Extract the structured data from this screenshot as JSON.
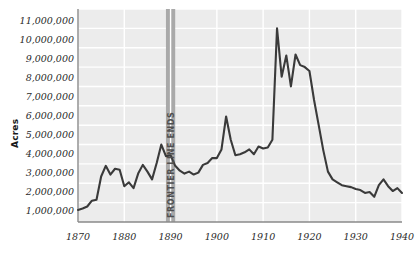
{
  "chart_data": {
    "type": "line",
    "title": "",
    "xlabel": "",
    "ylabel": "Acres",
    "xlim": [
      1870,
      1940
    ],
    "ylim": [
      0,
      11000000
    ],
    "grid": true,
    "legend": "none",
    "x_ticks": [
      "1870",
      "1880",
      "1890",
      "1900",
      "1910",
      "1920",
      "1930",
      "1940"
    ],
    "x_tick_values": [
      1870,
      1880,
      1890,
      1900,
      1910,
      1920,
      1930,
      1940
    ],
    "y_ticks": [
      "1,000,000",
      "2,000,000",
      "3,000,000",
      "4,000,000",
      "5,000,000",
      "6,000,000",
      "7,000,000",
      "8,000,000",
      "9,000,000",
      "10,000,000",
      "11,000,000"
    ],
    "y_tick_values": [
      1000000,
      2000000,
      3000000,
      4000000,
      5000000,
      6000000,
      7000000,
      8000000,
      9000000,
      10000000,
      11000000
    ],
    "annotations": [
      {
        "label": "FRONTIER LINE ENDS",
        "type": "vertical-band",
        "x_start": 1889,
        "x_end": 1891
      }
    ],
    "series": [
      {
        "name": "Acres",
        "color": "#3a3a3a",
        "x": [
          1870,
          1871,
          1872,
          1873,
          1874,
          1875,
          1876,
          1877,
          1878,
          1879,
          1880,
          1881,
          1882,
          1883,
          1884,
          1885,
          1886,
          1887,
          1888,
          1889,
          1890,
          1891,
          1892,
          1893,
          1894,
          1895,
          1896,
          1897,
          1898,
          1899,
          1900,
          1901,
          1902,
          1903,
          1904,
          1905,
          1906,
          1907,
          1908,
          1909,
          1910,
          1911,
          1912,
          1913,
          1914,
          1915,
          1916,
          1917,
          1918,
          1919,
          1920,
          1921,
          1922,
          1923,
          1924,
          1925,
          1926,
          1927,
          1928,
          1929,
          1930,
          1931,
          1932,
          1933,
          1934,
          1935,
          1936,
          1937,
          1938,
          1939,
          1940
        ],
        "y": [
          620000,
          700000,
          800000,
          1100000,
          1150000,
          2350000,
          2900000,
          2450000,
          2750000,
          2700000,
          1850000,
          2050000,
          1750000,
          2500000,
          2950000,
          2600000,
          2200000,
          3050000,
          4000000,
          3400000,
          3450000,
          2900000,
          2650000,
          2500000,
          2600000,
          2450000,
          2550000,
          2950000,
          3050000,
          3300000,
          3300000,
          3750000,
          5450000,
          4250000,
          3450000,
          3500000,
          3600000,
          3750000,
          3500000,
          3900000,
          3800000,
          3850000,
          4250000,
          10000000,
          7500000,
          8600000,
          7000000,
          8650000,
          8100000,
          8000000,
          7800000,
          6300000,
          5000000,
          3700000,
          2600000,
          2200000,
          2050000,
          1900000,
          1850000,
          1800000,
          1700000,
          1650000,
          1500000,
          1550000,
          1300000,
          1900000,
          2200000,
          1850000,
          1600000,
          1750000,
          1500000
        ]
      }
    ]
  },
  "colors": {
    "plot_background": "#ececec",
    "gridline": "#ffffff",
    "axis_line": "#8a8a8a",
    "line": "#3a3a3a",
    "band": "#a9a9a9",
    "text": "#2a2a2a"
  }
}
